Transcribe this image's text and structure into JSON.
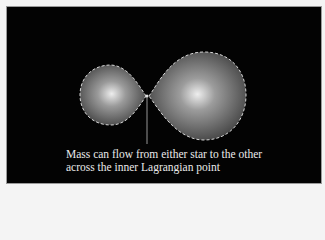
{
  "diagram": {
    "caption": {
      "line1": "Mass can flow from either star to the other",
      "line2": "across the inner Lagrangian point"
    },
    "elements": {
      "left_star": "smaller star inside Roche lobe",
      "right_star": "larger star inside Roche lobe",
      "lagrangian_point": "inner Lagrangian point (L1)"
    },
    "colors": {
      "background": "#030303",
      "star_center": "#e8e8e8",
      "star_edge": "#3a3a3a",
      "lobe_outline": "#d8d8d8"
    }
  }
}
